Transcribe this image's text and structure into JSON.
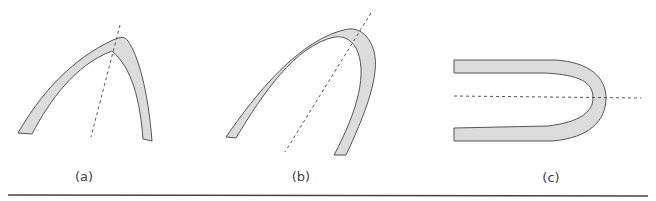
{
  "figure": {
    "panels": [
      {
        "id": "a",
        "label": "(a)",
        "description": "shallow asymmetric arch band with tilted dashed axis"
      },
      {
        "id": "b",
        "label": "(b)",
        "description": "deep inverted-U band with tilted dashed axis"
      },
      {
        "id": "c",
        "label": "(c)",
        "description": "horizontal U-shaped band opening left with horizontal dashed axis"
      }
    ],
    "colors": {
      "band_fill": "#dcdcdc",
      "band_stroke": "#555555",
      "axis_stroke": "#555555",
      "rule": "#444444"
    }
  }
}
